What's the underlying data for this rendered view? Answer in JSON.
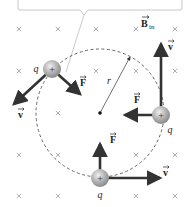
{
  "figure": {
    "field_label": "B",
    "field_subscript": "in",
    "radius_label": "r",
    "charge_label": "q",
    "charge_sign": "+",
    "force_label": "F",
    "velocity_label": "v",
    "colors": {
      "arrow": "#333333",
      "field_mark": "#b0b0b0",
      "callout_border": "#c8c8c8",
      "charge": "#9a9a9a"
    }
  },
  "field_marks": [
    [
      19,
      29
    ],
    [
      58,
      29
    ],
    [
      96,
      29
    ],
    [
      136,
      29
    ],
    [
      175,
      29
    ],
    [
      19,
      71
    ],
    [
      96,
      71
    ],
    [
      136,
      71
    ],
    [
      175,
      71
    ],
    [
      58,
      113
    ],
    [
      19,
      155
    ],
    [
      58,
      155
    ],
    [
      136,
      155
    ],
    [
      175,
      155
    ],
    [
      19,
      196
    ],
    [
      58,
      196
    ],
    [
      136,
      196
    ],
    [
      175,
      196
    ]
  ],
  "orbit": {
    "cx": 100,
    "cy": 113,
    "r": 64
  },
  "charges": [
    {
      "name": "charge-top-left",
      "x": 52,
      "y": 69,
      "q_pos": [
        36,
        72
      ],
      "v_tip": [
        14,
        104
      ],
      "v_label": [
        18,
        118
      ],
      "f_tip": [
        80,
        94
      ],
      "f_label": [
        80,
        86
      ]
    },
    {
      "name": "charge-right",
      "x": 161,
      "y": 115,
      "q_pos": [
        170,
        133
      ],
      "v_tip": [
        161,
        44
      ],
      "v_label": [
        168,
        50
      ],
      "f_tip": [
        125,
        115
      ],
      "f_label": [
        134,
        103
      ]
    },
    {
      "name": "charge-bottom",
      "x": 100,
      "y": 178,
      "q_pos": [
        100,
        198
      ],
      "v_tip": [
        160,
        178
      ],
      "v_label": [
        163,
        176
      ],
      "f_tip": [
        100,
        144
      ],
      "f_label": [
        110,
        143
      ]
    }
  ]
}
